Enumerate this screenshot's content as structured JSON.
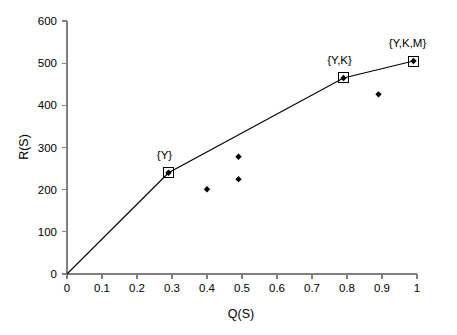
{
  "chart_data": {
    "type": "scatter",
    "title": "",
    "subtitle": "",
    "xlabel": "Q(S)",
    "ylabel": "R(S)",
    "xlim": [
      0,
      1
    ],
    "ylim": [
      0,
      600
    ],
    "xticks": [
      "0",
      "0.1",
      "0.2",
      "0.3",
      "0.4",
      "0.5",
      "0.6",
      "0.7",
      "0.8",
      "0.9",
      "1"
    ],
    "xtick_values": [
      0,
      0.1,
      0.2,
      0.3,
      0.4,
      0.5,
      0.6,
      0.7,
      0.8,
      0.9,
      1
    ],
    "yticks": [
      "0",
      "100",
      "200",
      "300",
      "400",
      "500",
      "600"
    ],
    "ytick_values": [
      0,
      100,
      200,
      300,
      400,
      500,
      600
    ],
    "grid": false,
    "legend": "none",
    "series": [
      {
        "name": "frontier",
        "type": "line",
        "marker": "boxed-diamond",
        "points": [
          {
            "x": 0.0,
            "y": 0,
            "label": ""
          },
          {
            "x": 0.29,
            "y": 240,
            "label": "{Y}"
          },
          {
            "x": 0.79,
            "y": 465,
            "label": "{Y,K}"
          },
          {
            "x": 0.99,
            "y": 505,
            "label": "{Y,K,M}"
          }
        ]
      },
      {
        "name": "other-subsets",
        "type": "scatter",
        "marker": "diamond",
        "points": [
          {
            "x": 0.4,
            "y": 201,
            "label": ""
          },
          {
            "x": 0.49,
            "y": 278,
            "label": ""
          },
          {
            "x": 0.49,
            "y": 225,
            "label": ""
          },
          {
            "x": 0.89,
            "y": 426,
            "label": ""
          }
        ]
      }
    ],
    "annotations": [
      {
        "text": "{Y}",
        "x": 0.29,
        "y": 240,
        "dx": -4,
        "dy": -14
      },
      {
        "text": "{Y,K}",
        "x": 0.79,
        "y": 465,
        "dx": -4,
        "dy": -14
      },
      {
        "text": "{Y,K,M}",
        "x": 0.99,
        "y": 505,
        "dx": -6,
        "dy": -14
      }
    ],
    "colors": {
      "axis": "#808080",
      "line": "#000000",
      "marker": "#000000",
      "text": "#000000",
      "background": "#ffffff"
    }
  }
}
